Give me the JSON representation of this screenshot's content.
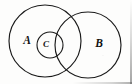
{
  "figure": {
    "kind": "venn-diagram",
    "title": "",
    "caption": "",
    "background_color": "#fdfdfc",
    "stroke_color": "#1a1a1a",
    "width": 132,
    "height": 84,
    "sets": [
      {
        "id": "A",
        "label": "A",
        "label_x": 27,
        "label_y": 41,
        "center_x": 45,
        "center_y": 41,
        "radius": 36,
        "stroke_width": 1.15
      },
      {
        "id": "B",
        "label": "B",
        "label_x": 99,
        "label_y": 44,
        "center_x": 88,
        "center_y": 45,
        "radius": 33,
        "stroke_width": 1.15
      },
      {
        "id": "C",
        "label": "C",
        "label_x": 46,
        "label_y": 45,
        "center_x": 50,
        "center_y": 45,
        "radius": 13,
        "stroke_width": 1.1
      }
    ]
  }
}
